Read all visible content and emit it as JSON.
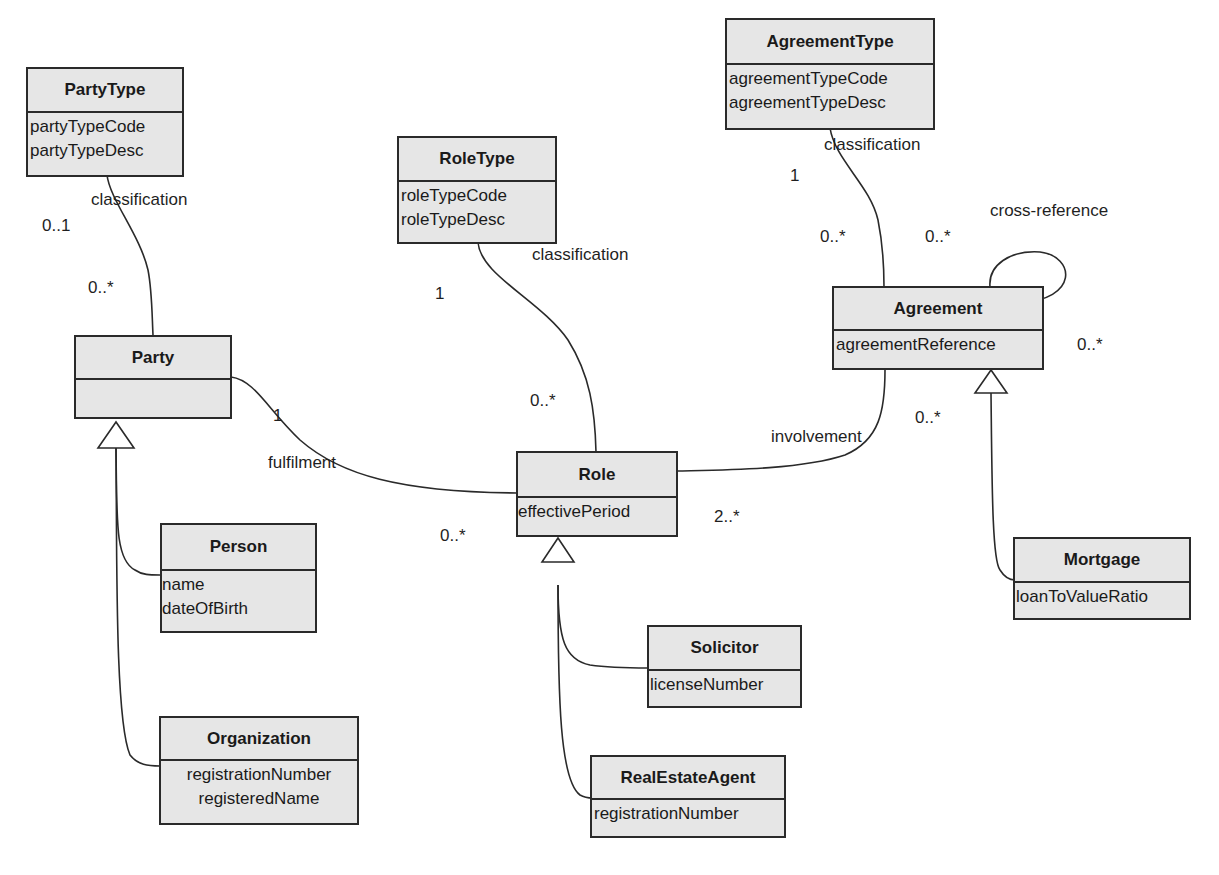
{
  "diagram": {
    "type": "UML class diagram",
    "classes": [
      {
        "id": "PartyType",
        "name": "PartyType",
        "attributes": [
          "partyTypeCode",
          "partyTypeDesc"
        ]
      },
      {
        "id": "Party",
        "name": "Party",
        "attributes": []
      },
      {
        "id": "Person",
        "name": "Person",
        "attributes": [
          "name",
          "dateOfBirth"
        ]
      },
      {
        "id": "Organization",
        "name": "Organization",
        "attributes": [
          "registrationNumber",
          "registeredName"
        ]
      },
      {
        "id": "RoleType",
        "name": "RoleType",
        "attributes": [
          "roleTypeCode",
          "roleTypeDesc"
        ]
      },
      {
        "id": "Role",
        "name": "Role",
        "attributes": [
          "effectivePeriod"
        ]
      },
      {
        "id": "Solicitor",
        "name": "Solicitor",
        "attributes": [
          "licenseNumber"
        ]
      },
      {
        "id": "RealEstateAgent",
        "name": "RealEstateAgent",
        "attributes": [
          "registrationNumber"
        ]
      },
      {
        "id": "AgreementType",
        "name": "AgreementType",
        "attributes": [
          "agreementTypeCode",
          "agreementTypeDesc"
        ]
      },
      {
        "id": "Agreement",
        "name": "Agreement",
        "attributes": [
          "agreementReference"
        ]
      },
      {
        "id": "Mortgage",
        "name": "Mortgage",
        "attributes": [
          "loanToValueRatio"
        ]
      }
    ],
    "associations": [
      {
        "name": "classification",
        "from": "PartyType",
        "to": "Party",
        "from_mult": "0..1",
        "to_mult": "0..*"
      },
      {
        "name": "classification",
        "from": "RoleType",
        "to": "Role",
        "from_mult": "1",
        "to_mult": "0..*"
      },
      {
        "name": "classification",
        "from": "AgreementType",
        "to": "Agreement",
        "from_mult": "1",
        "to_mult": "0..*"
      },
      {
        "name": "fulfilment",
        "from": "Party",
        "to": "Role",
        "from_mult": "1",
        "to_mult": "0..*"
      },
      {
        "name": "involvement",
        "from": "Role",
        "to": "Agreement",
        "from_mult": "2..*",
        "to_mult": "0..*"
      },
      {
        "name": "cross-reference",
        "from": "Agreement",
        "to": "Agreement",
        "from_mult": "0..*",
        "to_mult": "0..*"
      }
    ],
    "generalizations": [
      {
        "child": "Person",
        "parent": "Party"
      },
      {
        "child": "Organization",
        "parent": "Party"
      },
      {
        "child": "Solicitor",
        "parent": "Role"
      },
      {
        "child": "RealEstateAgent",
        "parent": "Role"
      },
      {
        "child": "Mortgage",
        "parent": "Agreement"
      }
    ]
  },
  "labels": {
    "partytype_assoc": "classification",
    "partytype_mult": "0..1",
    "party_mult_top": "0..*",
    "roletype_assoc": "classification",
    "roletype_mult": "1",
    "role_mult_top": "0..*",
    "agreementtype_assoc": "classification",
    "agreementtype_mult": "1",
    "agreement_mult_top": "0..*",
    "crossref_assoc": "cross-reference",
    "crossref_mult_left": "0..*",
    "crossref_mult_right": "0..*",
    "fulfilment_assoc": "fulfilment",
    "fulfilment_mult_party": "1",
    "fulfilment_mult_role": "0..*",
    "involvement_assoc": "involvement",
    "involvement_mult_role": "2..*",
    "involvement_mult_agreement": "0..*"
  }
}
